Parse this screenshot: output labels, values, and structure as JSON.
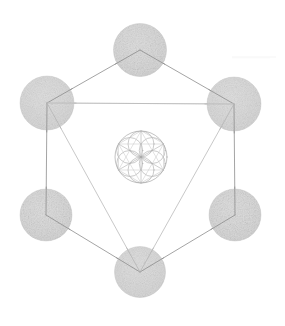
{
  "figure": {
    "background_color": "#ffffff",
    "canvas": {
      "width": 285,
      "height": 326
    }
  },
  "palette": {
    "line_color": "#8d8d8d",
    "line_color_faint": "#c9c9c9",
    "line_color_soft": "#b0b0b0",
    "sphere_fill_outer": "#d2d2d2",
    "sphere_fill_inner": "#fbfbfb",
    "sphere_edge": "#c2c2c2",
    "rosette_color": "#a7a7a7",
    "rosette_color_faint": "#c4c4c4",
    "background_color": "#ffffff"
  },
  "chart_data": {
    "type": "diagram",
    "subtitle": "",
    "grid": false,
    "legend": false,
    "xlim": [
      0,
      285
    ],
    "ylim": [
      0,
      326
    ],
    "spheres": [
      {
        "name": "top",
        "cx": 140,
        "cy": 50,
        "r": 26.5
      },
      {
        "name": "upper-right",
        "cx": 234,
        "cy": 104,
        "r": 27.0
      },
      {
        "name": "lower-right",
        "cx": 235,
        "cy": 215,
        "r": 26.0
      },
      {
        "name": "bottom",
        "cx": 140,
        "cy": 272,
        "r": 25.5
      },
      {
        "name": "lower-left",
        "cx": 46,
        "cy": 215,
        "r": 26.0
      },
      {
        "name": "upper-left",
        "cx": 47,
        "cy": 103,
        "r": 27.0
      }
    ],
    "hexagon_edges": [
      {
        "from": "top",
        "to": "upper-right",
        "weight": "strong"
      },
      {
        "from": "upper-right",
        "to": "lower-right",
        "weight": "strong"
      },
      {
        "from": "lower-right",
        "to": "bottom",
        "weight": "strong"
      },
      {
        "from": "bottom",
        "to": "lower-left",
        "weight": "strong"
      },
      {
        "from": "lower-left",
        "to": "upper-left",
        "weight": "strong"
      },
      {
        "from": "upper-left",
        "to": "top",
        "weight": "strong"
      }
    ],
    "triangle_down": {
      "vertices": [
        "upper-left",
        "upper-right",
        "bottom"
      ],
      "weight": "soft"
    },
    "chords_faint": [
      {
        "from": "upper-left",
        "to": "upper-right",
        "weight": "faint"
      }
    ],
    "rosette": {
      "name": "seed-of-life",
      "cx": 141,
      "cy": 157,
      "r": 26.0,
      "petal_count": 6,
      "petal_radius": 13.0,
      "has_hexagram": true,
      "has_hexagon": true
    }
  },
  "annotations": {
    "sphere_labels": [],
    "callouts": []
  }
}
